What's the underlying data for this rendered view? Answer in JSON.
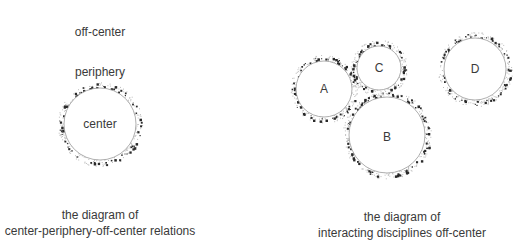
{
  "left_diagram": {
    "labels": {
      "off_center": "off-center",
      "periphery": "periphery",
      "center": "center"
    },
    "circle": {
      "cx": 100,
      "cy": 124,
      "r": 36
    },
    "caption": {
      "line1": "the diagram of",
      "line2": "center-periphery-off-center relations"
    }
  },
  "right_diagram": {
    "circles": [
      {
        "id": "A",
        "label": "A",
        "cx": 324,
        "cy": 89,
        "r": 28
      },
      {
        "id": "C",
        "label": "C",
        "cx": 379,
        "cy": 68,
        "r": 22
      },
      {
        "id": "B",
        "label": "B",
        "cx": 387,
        "cy": 135,
        "r": 38
      },
      {
        "id": "D",
        "label": "D",
        "cx": 475,
        "cy": 69,
        "r": 31
      }
    ],
    "caption": {
      "line1": "the diagram of",
      "line2": "interacting disciplines off-center"
    }
  },
  "colors": {
    "circle_stroke": "#9a9a9a",
    "periphery_dots": "#2a2a2a",
    "text": "#3a3a3a"
  }
}
